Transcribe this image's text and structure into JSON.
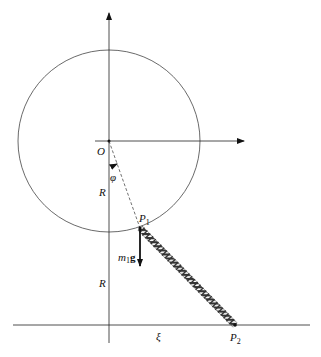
{
  "diagram": {
    "labels": {
      "origin": "O",
      "angle": "φ",
      "radius_upper": "R",
      "radius_lower": "R",
      "p1_main": "P",
      "p1_sub": "1",
      "p2_main": "P",
      "p2_sub": "2",
      "force_m": "m",
      "force_sub": "1",
      "force_g": "g",
      "xi": "ξ"
    },
    "colors": {
      "line": "#222222",
      "circle": "#444444",
      "spring": "#333333"
    }
  }
}
